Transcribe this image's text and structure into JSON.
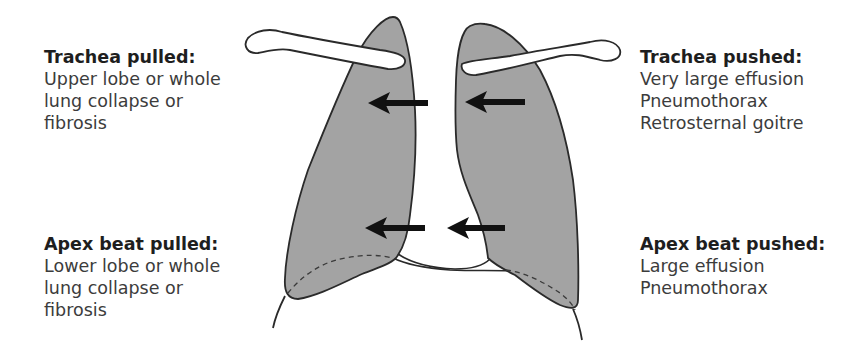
{
  "figure": {
    "type": "anatomical-diagram",
    "colors": {
      "lung_fill": "#a3a3a3",
      "outline": "#2a2a2a",
      "arrow": "#111111",
      "background": "#ffffff",
      "heading_text": "#1e1e1e",
      "body_text": "#3c3c3c"
    },
    "arrows": [
      {
        "id": "upper-left",
        "direction": "left",
        "meaning": "trachea pulled"
      },
      {
        "id": "upper-right",
        "direction": "left",
        "meaning": "trachea pushed"
      },
      {
        "id": "lower-left",
        "direction": "left",
        "meaning": "apex beat pulled"
      },
      {
        "id": "lower-right",
        "direction": "left",
        "meaning": "apex beat pushed"
      }
    ]
  },
  "labels": {
    "trachea_pulled": {
      "heading": "Trachea pulled:",
      "lines": [
        "Upper lobe or whole",
        "lung collapse or",
        "fibrosis"
      ]
    },
    "trachea_pushed": {
      "heading": "Trachea pushed:",
      "lines": [
        "Very large effusion",
        "Pneumothorax",
        "Retrosternal goitre"
      ]
    },
    "apex_pulled": {
      "heading": "Apex beat pulled:",
      "lines": [
        "Lower lobe or whole",
        "lung collapse or",
        "fibrosis"
      ]
    },
    "apex_pushed": {
      "heading": "Apex beat pushed:",
      "lines": [
        "Large effusion",
        "Pneumothorax"
      ]
    }
  }
}
